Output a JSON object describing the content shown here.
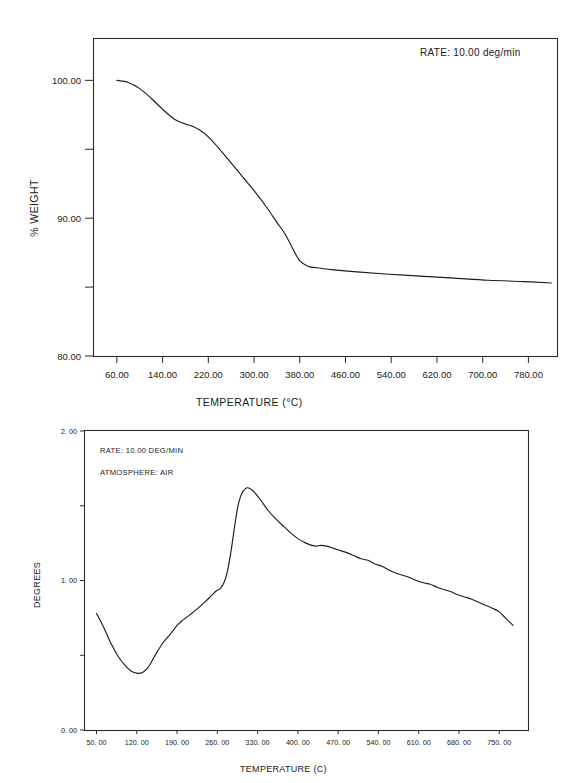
{
  "document": {
    "title": "Thermal analysis figure",
    "background_color": "#ffffff",
    "ink_color": "#1d1d1d"
  },
  "chart_data": [
    {
      "id": "tga",
      "type": "line",
      "title": "",
      "xlabel": "TEMPERATURE (°C)",
      "ylabel": "% WEIGHT",
      "xlim": [
        20,
        830
      ],
      "ylim": [
        80,
        103
      ],
      "grid": false,
      "legend": "none",
      "xticks": [
        60,
        140,
        220,
        300,
        380,
        460,
        540,
        620,
        700,
        780
      ],
      "xticklabels": [
        "60.00",
        "140.00",
        "220.00",
        "300.00",
        "380.00",
        "460.00",
        "540.00",
        "620.00",
        "700.00",
        "780.00"
      ],
      "yticks": [
        80,
        90,
        100
      ],
      "yticklabels": [
        "80.00",
        "90.00",
        "100.00"
      ],
      "yminorticks": [
        85,
        95
      ],
      "annotations": [
        {
          "name": "rate",
          "label": "RATE:",
          "value": "10.00  deg/min",
          "text": "RATE:     10.00  deg/min"
        }
      ],
      "series": [
        {
          "name": "weight-loss",
          "x": [
            60,
            80,
            100,
            120,
            140,
            160,
            175,
            190,
            205,
            220,
            240,
            260,
            280,
            300,
            320,
            340,
            355,
            370,
            380,
            395,
            410,
            440,
            480,
            530,
            590,
            650,
            710,
            770,
            820
          ],
          "y": [
            100.0,
            99.85,
            99.4,
            98.7,
            97.9,
            97.2,
            96.9,
            96.7,
            96.4,
            95.9,
            95.0,
            94.0,
            93.0,
            92.0,
            90.9,
            89.7,
            88.8,
            87.6,
            86.9,
            86.5,
            86.4,
            86.25,
            86.1,
            85.95,
            85.8,
            85.65,
            85.5,
            85.4,
            85.3
          ]
        }
      ]
    },
    {
      "id": "dta",
      "type": "line",
      "title": "",
      "xlabel": "TEMPERATURE (C)",
      "ylabel": "DEGREES",
      "xlim": [
        30,
        800
      ],
      "ylim": [
        0,
        2
      ],
      "grid": false,
      "legend": "none",
      "xticks": [
        50,
        120,
        190,
        260,
        330,
        400,
        470,
        540,
        610,
        680,
        750
      ],
      "xticklabels": [
        "50. 00",
        "120. 00",
        "190. 00",
        "260. 00",
        "330. 00",
        "400. 00",
        "470. 00",
        "540. 00",
        "610. 00",
        "680. 00",
        "750. 00"
      ],
      "yticks": [
        0,
        1,
        2
      ],
      "yticklabels": [
        "0. 00",
        "1. 00",
        "2. 00"
      ],
      "yminorticks": [
        0.5,
        1.5
      ],
      "annotations": [
        {
          "name": "rate",
          "label": "RATE:",
          "value": "10.00 DEG/MIN",
          "text": "RATE:  10.00 DEG/MIN"
        },
        {
          "name": "atmosphere",
          "label": "ATMOSPHERE:",
          "value": "AIR",
          "text": "ATMOSPHERE:  AIR"
        }
      ],
      "series": [
        {
          "name": "dta-signal",
          "x": [
            50,
            62,
            75,
            88,
            100,
            110,
            120,
            130,
            140,
            152,
            165,
            178,
            190,
            200,
            212,
            225,
            238,
            250,
            258,
            265,
            272,
            278,
            284,
            290,
            296,
            303,
            312,
            322,
            334,
            348,
            362,
            376,
            390,
            402,
            414,
            424,
            432,
            440,
            450,
            462,
            474,
            486,
            498,
            510,
            522,
            534,
            546,
            558,
            570,
            582,
            594,
            606,
            618,
            630,
            642,
            654,
            666,
            678,
            690,
            702,
            714,
            726,
            738,
            750,
            762,
            774
          ],
          "y": [
            0.78,
            0.69,
            0.58,
            0.49,
            0.43,
            0.395,
            0.38,
            0.385,
            0.42,
            0.5,
            0.58,
            0.64,
            0.7,
            0.735,
            0.77,
            0.81,
            0.855,
            0.9,
            0.93,
            0.945,
            0.99,
            1.07,
            1.2,
            1.36,
            1.5,
            1.585,
            1.62,
            1.6,
            1.545,
            1.47,
            1.41,
            1.36,
            1.31,
            1.275,
            1.25,
            1.235,
            1.23,
            1.235,
            1.23,
            1.215,
            1.2,
            1.185,
            1.165,
            1.145,
            1.135,
            1.11,
            1.095,
            1.07,
            1.05,
            1.035,
            1.02,
            1.0,
            0.985,
            0.975,
            0.955,
            0.94,
            0.925,
            0.905,
            0.89,
            0.875,
            0.855,
            0.835,
            0.815,
            0.79,
            0.745,
            0.7
          ]
        }
      ]
    }
  ]
}
